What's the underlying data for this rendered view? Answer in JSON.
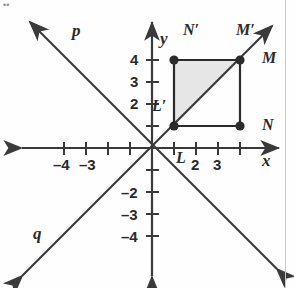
{
  "figure": {
    "type": "coordinate-plane-reflection",
    "origin_px": [
      152,
      148
    ],
    "unit_px": 22,
    "axes": {
      "x_label": "x",
      "y_label": "y",
      "x_tick_labels": [
        "–4",
        "–3",
        "2",
        "3"
      ],
      "y_tick_labels": [
        "4",
        "3",
        "2",
        "–2",
        "–3",
        "–4"
      ],
      "x_ticks": [
        -4,
        -3,
        -2,
        -1,
        1,
        2,
        3,
        4
      ],
      "y_ticks": [
        -4,
        -3,
        -2,
        -1,
        1,
        2,
        3,
        4
      ],
      "x_range": [
        -5.5,
        5.5
      ],
      "y_range": [
        -5.5,
        5.5
      ]
    },
    "lines": [
      {
        "name": "p",
        "label": "p",
        "slope": -1,
        "intercept": 0,
        "label_pos": [
          72,
          22
        ]
      },
      {
        "name": "q",
        "label": "q",
        "slope": 1,
        "intercept": 0,
        "label_pos": [
          33,
          225
        ]
      }
    ],
    "points": [
      {
        "name": "L-prime",
        "label": "L′",
        "x": 1,
        "y": 1,
        "label_pos": [
          124,
          100
        ],
        "dot": true
      },
      {
        "name": "N-prime",
        "label": "N′",
        "x": 1,
        "y": 4,
        "label_pos": [
          168,
          22
        ],
        "dot": true
      },
      {
        "name": "M-prime",
        "label": "M′",
        "x": 4,
        "y": 4,
        "label_pos": [
          232,
          22
        ],
        "dot": true
      },
      {
        "name": "M",
        "label": "M",
        "x": 4,
        "y": 4,
        "label_pos": [
          265,
          46
        ],
        "dot": false
      },
      {
        "name": "N",
        "label": "N",
        "x": 4,
        "y": 1,
        "label_pos": [
          265,
          112
        ],
        "dot": true
      },
      {
        "name": "L",
        "label": "L",
        "x": 1,
        "y": 0,
        "label_pos": [
          176,
          152
        ],
        "dot": false
      }
    ],
    "square": {
      "name": "square-LMN",
      "vertices": [
        [
          1,
          1
        ],
        [
          1,
          4
        ],
        [
          4,
          4
        ],
        [
          4,
          1
        ]
      ]
    },
    "shaded_triangle": {
      "name": "triangle-L-N-M-prime",
      "vertices": [
        [
          1,
          1
        ],
        [
          1,
          4
        ],
        [
          4,
          4
        ]
      ],
      "fill": "#e6e6e6"
    },
    "colors": {
      "ink": "#2b2b2b",
      "axis": "#3a3a3a",
      "shade": "#e6e6e6",
      "background": "#fefefe",
      "rule": "#c9c9c9"
    }
  }
}
